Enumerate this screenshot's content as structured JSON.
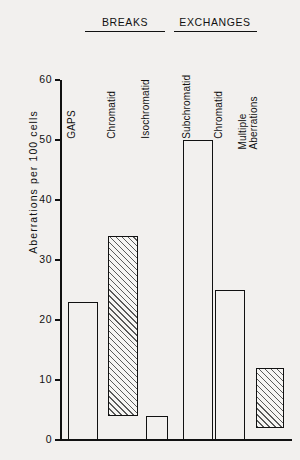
{
  "chart_data": {
    "type": "bar",
    "title": "",
    "xlabel": "",
    "ylabel": "Aberrations  per  100 cells",
    "ylim": [
      0,
      60
    ],
    "yticks": [
      0,
      10,
      20,
      30,
      40,
      50,
      60
    ],
    "ytick_labels": [
      "0",
      "10",
      "20",
      "30",
      "40",
      "50",
      "60"
    ],
    "grid": false,
    "legend": "none",
    "categories": [
      "GAPS",
      "Chromatid",
      "Isochromatid",
      "Subchromatid",
      "Chromatid",
      "Multiple Aberrations"
    ],
    "values": [
      23,
      34,
      4,
      50,
      25,
      12
    ],
    "series": [
      {
        "name": "Aberrations per 100 cells",
        "values": [
          23,
          34,
          4,
          50,
          25,
          12
        ]
      }
    ],
    "bars": [
      {
        "category": "GAPS",
        "label_line1": "GAPS",
        "label_line2": "",
        "total": 23,
        "hatched_from": 0,
        "hatched_to": 0,
        "fill": "open",
        "group": ""
      },
      {
        "category": "Chromatid",
        "label_line1": "Chromatid",
        "label_line2": "",
        "total": 34,
        "hatched_from": 4,
        "hatched_to": 34,
        "fill": "hatched",
        "group": "BREAKS"
      },
      {
        "category": "Isochromatid",
        "label_line1": "Isochromatid",
        "label_line2": "",
        "total": 4,
        "hatched_from": 0,
        "hatched_to": 0,
        "fill": "open",
        "group": "BREAKS"
      },
      {
        "category": "Subchromatid",
        "label_line1": "Subchromatid",
        "label_line2": "",
        "total": 50,
        "hatched_from": 0,
        "hatched_to": 0,
        "fill": "open",
        "group": "EXCHANGES"
      },
      {
        "category": "Chromatid",
        "label_line1": "Chromatid",
        "label_line2": "",
        "total": 25,
        "hatched_from": 0,
        "hatched_to": 0,
        "fill": "open",
        "group": "EXCHANGES"
      },
      {
        "category": "Multiple Aberrations",
        "label_line1": "Multiple",
        "label_line2": "Aberrations",
        "total": 12,
        "hatched_from": 2,
        "hatched_to": 12,
        "fill": "hatched",
        "group": ""
      }
    ],
    "groups": [
      {
        "name": "BREAKS",
        "members": [
          "Chromatid",
          "Isochromatid"
        ]
      },
      {
        "name": "EXCHANGES",
        "members": [
          "Subchromatid",
          "Chromatid"
        ]
      }
    ],
    "annotations": []
  },
  "style": {
    "background": "#f2f0ee",
    "ink": "#111111",
    "hatch_color": "#5a5a5a"
  }
}
